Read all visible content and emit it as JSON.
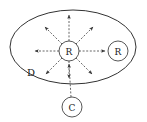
{
  "diagram": {
    "type": "radial-broadcast-diagram",
    "canvas": {
      "width": 147,
      "height": 122,
      "background": "#ffffff"
    },
    "colors": {
      "boundary_stroke": "#333333",
      "node_stroke": "#444444",
      "node_fill": "#ffffff",
      "arrow_stroke": "#555555",
      "text": "#1a1a1a"
    },
    "region": {
      "shape": "ellipse",
      "label": "D",
      "label_x": 31,
      "label_y": 73,
      "cx": 73,
      "cy": 47,
      "rx": 63,
      "ry": 37
    },
    "nodes": [
      {
        "id": "center-router",
        "label": "R",
        "cx": 69,
        "cy": 51,
        "r": 10,
        "inside_region": true
      },
      {
        "id": "right-router",
        "label": "R",
        "cx": 118,
        "cy": 51,
        "r": 10,
        "inside_region": true
      },
      {
        "id": "client",
        "label": "C",
        "cx": 72,
        "cy": 107,
        "r": 10,
        "inside_region": false
      }
    ],
    "edges": [
      {
        "id": "broadcast-n",
        "direction": "north",
        "from": "center-router",
        "style": "dashed",
        "arrow": "outward",
        "x1": 69,
        "y1": 41,
        "x2": 69,
        "y2": 14
      },
      {
        "id": "broadcast-ne",
        "direction": "northeast",
        "from": "center-router",
        "style": "dashed",
        "arrow": "outward",
        "x1": 76,
        "y1": 44,
        "x2": 94,
        "y2": 26
      },
      {
        "id": "broadcast-e",
        "direction": "east",
        "from": "center-router",
        "style": "dashed",
        "arrow": "outward",
        "x1": 79,
        "y1": 51,
        "x2": 106,
        "y2": 51
      },
      {
        "id": "broadcast-se",
        "direction": "southeast",
        "from": "center-router",
        "style": "dashed",
        "arrow": "outward",
        "x1": 76,
        "y1": 58,
        "x2": 93,
        "y2": 75
      },
      {
        "id": "broadcast-s",
        "direction": "south",
        "from": "center-router",
        "style": "dashed",
        "arrow": "outward",
        "x1": 69,
        "y1": 61,
        "x2": 69,
        "y2": 79
      },
      {
        "id": "broadcast-sw",
        "direction": "southwest",
        "from": "center-router",
        "style": "dashed",
        "arrow": "outward",
        "x1": 62,
        "y1": 58,
        "x2": 45,
        "y2": 75
      },
      {
        "id": "broadcast-w",
        "direction": "west",
        "from": "center-router",
        "style": "dashed",
        "arrow": "outward",
        "x1": 59,
        "y1": 51,
        "x2": 34,
        "y2": 51
      },
      {
        "id": "broadcast-nw",
        "direction": "northwest",
        "from": "center-router",
        "style": "dashed",
        "arrow": "outward",
        "x1": 62,
        "y1": 44,
        "x2": 44,
        "y2": 26
      },
      {
        "id": "client-to-router",
        "direction": "north",
        "from": "client",
        "to": "center-router",
        "style": "dashed",
        "arrow": "inward",
        "x1": 71,
        "y1": 97,
        "x2": 69,
        "y2": 63
      }
    ],
    "labels": {
      "region": "D",
      "center_node": "R",
      "right_node": "R",
      "client_node": "C"
    }
  }
}
